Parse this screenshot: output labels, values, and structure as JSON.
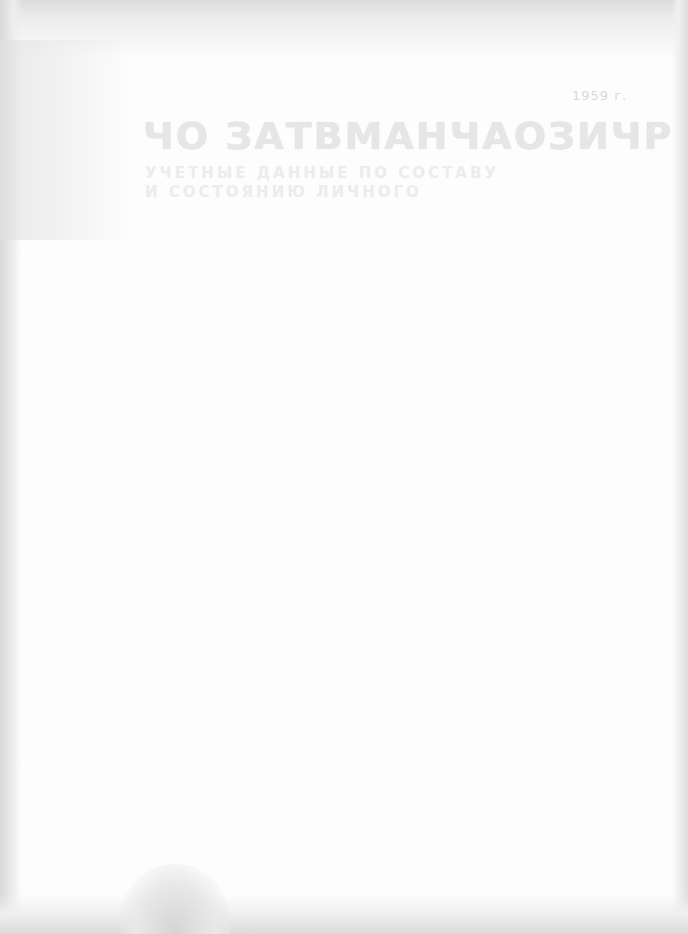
{
  "page": {
    "label": "1959 г.",
    "title": "ЧО ЗАТВМАНЧАОЗИЧР",
    "subtitle_lines": [
      "УЧЕТНЫЕ ДАННЫЕ ПО СОСТАВУ",
      "И СОСТОЯНИЮ ЛИЧНОГО"
    ]
  }
}
